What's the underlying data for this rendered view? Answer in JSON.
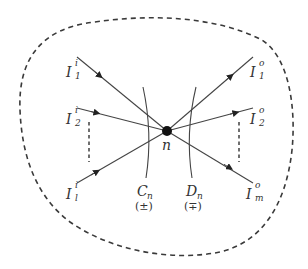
{
  "diagram": {
    "type": "node-flow",
    "colors": {
      "stroke": "#3a3a3a",
      "text": "#333333",
      "background": "#ffffff"
    },
    "boundary": {
      "style": "dashed",
      "shape": "closed-blob"
    },
    "node": {
      "label": "n"
    },
    "inputs": [
      {
        "main": "I",
        "sub": "1",
        "sup": "i"
      },
      {
        "main": "I",
        "sub": "2",
        "sup": "i"
      },
      {
        "main": "I",
        "sub": "l",
        "sup": "i"
      }
    ],
    "outputs": [
      {
        "main": "I",
        "sub": "1",
        "sup": "o"
      },
      {
        "main": "I",
        "sub": "2",
        "sup": "o"
      },
      {
        "main": "I",
        "sub": "m",
        "sup": "o"
      }
    ],
    "cuts": [
      {
        "main": "C",
        "sub": "n",
        "sign": "(±)"
      },
      {
        "main": "D",
        "sub": "n",
        "sign": "(∓)"
      }
    ]
  }
}
